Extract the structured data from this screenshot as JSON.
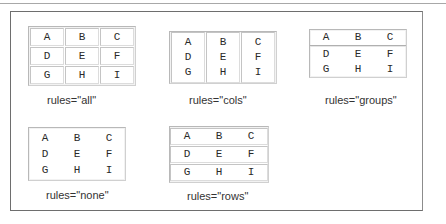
{
  "cells": [
    [
      "A",
      "B",
      "C"
    ],
    [
      "D",
      "E",
      "F"
    ],
    [
      "G",
      "H",
      "I"
    ]
  ],
  "examples": {
    "all": {
      "caption": "rules=\"all\""
    },
    "cols": {
      "caption": "rules=\"cols\""
    },
    "groups": {
      "caption": "rules=\"groups\""
    },
    "none": {
      "caption": "rules=\"none\""
    },
    "rows": {
      "caption": "rules=\"rows\""
    }
  }
}
